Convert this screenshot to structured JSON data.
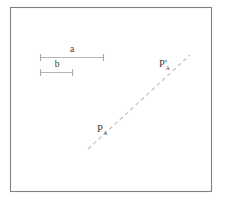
{
  "figure": {
    "kind": "geometry-diagram",
    "background_color": "#ffffff",
    "frame": {
      "stroke_color": "#808080",
      "x": 10,
      "y": 7,
      "width": 202,
      "height": 185
    },
    "segments": [
      {
        "id": "segment-a",
        "label": "a",
        "line_color": "#b4b4b4",
        "x1": 40,
        "x2": 104,
        "y": 57,
        "label_x": 72,
        "label_y": 52
      },
      {
        "id": "segment-b",
        "label": "b",
        "line_color": "#b4b4b4",
        "x1": 40,
        "x2": 73,
        "y": 72,
        "label_x": 57,
        "label_y": 67
      }
    ],
    "guide_line": {
      "id": "dashed-guide-line",
      "stroke_color": "#c2c2c2",
      "dash_pattern": "4 3.2",
      "x1": 88,
      "y1": 149,
      "x2": 190,
      "y2": 55
    },
    "points": [
      {
        "id": "point-p",
        "label": "P",
        "prime": "",
        "subscript": "A",
        "x": 97,
        "y": 132
      },
      {
        "id": "point-p-prime",
        "label": "P",
        "prime": "'",
        "subscript": "A",
        "x": 159,
        "y": 67
      }
    ]
  }
}
